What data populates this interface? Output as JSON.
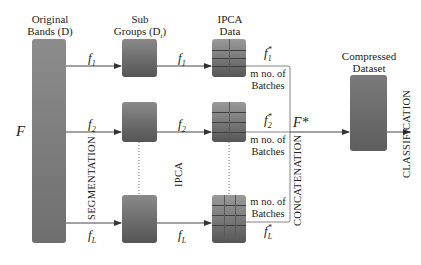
{
  "diagram": {
    "headers": {
      "original": [
        "Original",
        "Bands (D)"
      ],
      "sub": [
        "Sub",
        "Groups (D"
      ],
      "sub_subscript": "i",
      "sub_close": ")",
      "ipca": [
        "IPCA",
        "Data"
      ],
      "compressed": [
        "Compressed",
        "Dataset"
      ]
    },
    "input_label": "F",
    "output_label": "F*",
    "stage_labels": {
      "segmentation": "SEGMENTATION",
      "ipca": "IPCA",
      "concatenation": "CONCATENATION",
      "classification": "CLASSIFICATION"
    },
    "rows": [
      {
        "seg_label": "f",
        "seg_sub": "1",
        "ipca_label": "f",
        "ipca_sub": "1",
        "out_label": "f",
        "out_sup": "*",
        "out_sub": "1",
        "batch": [
          "m no. of",
          "Batches"
        ]
      },
      {
        "seg_label": "f",
        "seg_sub": "2",
        "ipca_label": "f",
        "ipca_sub": "2",
        "out_label": "f",
        "out_sup": "*",
        "out_sub": "2",
        "batch": [
          "m no. of",
          "Batches"
        ]
      },
      {
        "seg_label": "f",
        "seg_sub": "L",
        "ipca_label": "f",
        "ipca_sub": "L",
        "out_label": "f",
        "out_sup": "*",
        "out_sub": "L",
        "batch": [
          "m no. of",
          "Batches"
        ]
      }
    ]
  }
}
